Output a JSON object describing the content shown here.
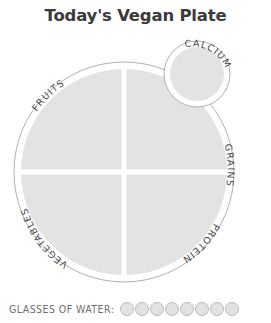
{
  "page": {
    "title": "Today's Vegan Plate",
    "background_color": "#ffffff"
  },
  "colors": {
    "plate_fill": "#e3e3e3",
    "plate_outline": "#b0b0b0",
    "divider": "#ffffff",
    "label_text": "#4a4a4a",
    "title_text": "#3b3b3b",
    "water_label_text": "#6e6e6e",
    "glass_fill": "#e2e2e2",
    "glass_stroke": "#b9b9b9"
  },
  "plate": {
    "name": "main-plate",
    "center": {
      "x": 124,
      "y": 172
    },
    "outer_radius": 110,
    "inner_radius": 103,
    "divider_width": 5,
    "quadrants": [
      {
        "id": "fruits",
        "label": "FRUITS",
        "position": "top-left"
      },
      {
        "id": "grains",
        "label": "GRAINS",
        "position": "top-right"
      },
      {
        "id": "vegetables",
        "label": "VEGETABLES",
        "position": "bottom-left"
      },
      {
        "id": "protein",
        "label": "PROTEIN",
        "position": "bottom-right"
      }
    ]
  },
  "calcium_circle": {
    "name": "calcium-circle",
    "label": "CALCIUM",
    "center": {
      "x": 197,
      "y": 74
    },
    "outer_radius": 33,
    "inner_radius": 27
  },
  "water": {
    "label": "GLASSES OF WATER:",
    "total_glasses": 8,
    "filled_glasses": 0,
    "glasses": [
      {
        "index": 1,
        "filled": false
      },
      {
        "index": 2,
        "filled": false
      },
      {
        "index": 3,
        "filled": false
      },
      {
        "index": 4,
        "filled": false
      },
      {
        "index": 5,
        "filled": false
      },
      {
        "index": 6,
        "filled": false
      },
      {
        "index": 7,
        "filled": false
      },
      {
        "index": 8,
        "filled": false
      }
    ]
  }
}
